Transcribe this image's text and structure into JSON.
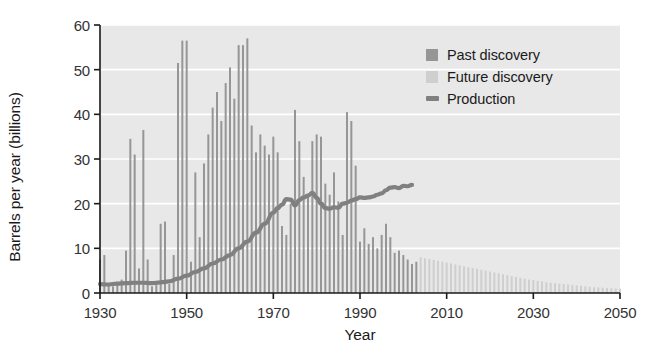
{
  "chart_data": {
    "type": "bar",
    "title": "",
    "xlabel": "Year",
    "ylabel": "Barrels per year (billions)",
    "xlim": [
      1930,
      2050
    ],
    "ylim": [
      0,
      60
    ],
    "xticks": [
      1930,
      1950,
      1970,
      1990,
      2010,
      2030,
      2050
    ],
    "yticks": [
      0,
      10,
      20,
      30,
      40,
      50,
      60
    ],
    "grid": "horizontal-white",
    "legend_position": "top-right-inside",
    "colors": {
      "past_discovery": "#969696",
      "future_discovery": "#cfcfcf",
      "production": "#808080",
      "plot_background": "#e8e8e8",
      "gridline": "#ffffff",
      "axis": "#1a1a1a",
      "text": "#1a1a1a"
    },
    "series": [
      {
        "name": "Past discovery",
        "type": "bar",
        "color": "#969696",
        "x": [
          1930,
          1931,
          1932,
          1933,
          1934,
          1935,
          1936,
          1937,
          1938,
          1939,
          1940,
          1941,
          1942,
          1943,
          1944,
          1945,
          1946,
          1947,
          1948,
          1949,
          1950,
          1951,
          1952,
          1953,
          1954,
          1955,
          1956,
          1957,
          1958,
          1959,
          1960,
          1961,
          1962,
          1963,
          1964,
          1965,
          1966,
          1967,
          1968,
          1969,
          1970,
          1971,
          1972,
          1973,
          1974,
          1975,
          1976,
          1977,
          1978,
          1979,
          1980,
          1981,
          1982,
          1983,
          1984,
          1985,
          1986,
          1987,
          1988,
          1989,
          1990,
          1991,
          1992,
          1993,
          1994,
          1995,
          1996,
          1997,
          1998,
          1999,
          2000,
          2001,
          2002,
          2003
        ],
        "values": [
          7.5,
          8.5,
          2.0,
          1.5,
          2.5,
          3.0,
          9.5,
          34.5,
          31.0,
          5.5,
          36.5,
          7.5,
          1.5,
          2.0,
          15.5,
          16.0,
          2.0,
          8.5,
          51.5,
          56.5,
          56.5,
          7.0,
          27.0,
          12.5,
          29.0,
          35.5,
          41.5,
          45.0,
          38.5,
          47.0,
          50.5,
          43.5,
          55.5,
          55.5,
          57.0,
          37.5,
          31.5,
          35.5,
          33.0,
          31.0,
          35.0,
          31.5,
          15.0,
          13.0,
          20.0,
          41.0,
          34.0,
          26.0,
          22.0,
          34.0,
          35.5,
          35.0,
          24.5,
          22.0,
          27.0,
          20.5,
          13.0,
          40.5,
          38.5,
          28.5,
          11.5,
          14.5,
          11.0,
          12.5,
          10.0,
          13.0,
          15.5,
          12.5,
          9.0,
          9.5,
          8.5,
          7.5,
          6.5,
          7.0
        ]
      },
      {
        "name": "Future discovery",
        "type": "bar",
        "color": "#cfcfcf",
        "x": [
          2004,
          2005,
          2006,
          2007,
          2008,
          2009,
          2010,
          2011,
          2012,
          2013,
          2014,
          2015,
          2016,
          2017,
          2018,
          2019,
          2020,
          2021,
          2022,
          2023,
          2024,
          2025,
          2026,
          2027,
          2028,
          2029,
          2030,
          2031,
          2032,
          2033,
          2034,
          2035,
          2036,
          2037,
          2038,
          2039,
          2040,
          2041,
          2042,
          2043,
          2044,
          2045,
          2046,
          2047,
          2048,
          2049,
          2050
        ],
        "values": [
          8.0,
          7.8,
          7.6,
          7.4,
          7.2,
          7.0,
          6.8,
          6.6,
          6.4,
          6.2,
          6.0,
          5.8,
          5.6,
          5.4,
          5.2,
          5.0,
          4.8,
          4.6,
          4.4,
          4.2,
          4.0,
          3.8,
          3.6,
          3.4,
          3.2,
          3.0,
          2.9,
          2.7,
          2.6,
          2.4,
          2.3,
          2.2,
          2.1,
          2.0,
          1.9,
          1.8,
          1.7,
          1.6,
          1.5,
          1.4,
          1.3,
          1.25,
          1.2,
          1.1,
          1.05,
          1.0,
          0.95
        ]
      },
      {
        "name": "Production",
        "type": "line",
        "color": "#808080",
        "x": [
          1930,
          1932,
          1934,
          1936,
          1938,
          1940,
          1942,
          1944,
          1946,
          1948,
          1950,
          1952,
          1954,
          1956,
          1958,
          1960,
          1962,
          1964,
          1966,
          1968,
          1970,
          1971,
          1972,
          1973,
          1974,
          1975,
          1976,
          1977,
          1978,
          1979,
          1980,
          1981,
          1982,
          1983,
          1984,
          1985,
          1986,
          1987,
          1988,
          1989,
          1990,
          1991,
          1992,
          1993,
          1994,
          1995,
          1996,
          1997,
          1998,
          1999,
          2000,
          2001,
          2002
        ],
        "values": [
          2.0,
          1.9,
          2.1,
          2.2,
          2.3,
          2.3,
          2.2,
          2.4,
          2.6,
          3.2,
          3.9,
          4.7,
          5.5,
          6.6,
          7.5,
          8.5,
          10.0,
          11.5,
          13.5,
          15.5,
          18.0,
          19.0,
          19.8,
          21.0,
          20.9,
          19.6,
          20.8,
          21.4,
          21.8,
          22.4,
          21.3,
          20.0,
          19.0,
          18.9,
          19.2,
          19.1,
          20.0,
          20.2,
          20.7,
          21.0,
          21.4,
          21.3,
          21.4,
          21.6,
          22.0,
          22.3,
          23.0,
          23.6,
          23.7,
          23.5,
          24.0,
          23.9,
          24.2
        ]
      }
    ],
    "annotations": []
  },
  "axis": {
    "ylabel": "Barrels per year (billions)",
    "xlabel": "Year",
    "ytick_labels": [
      "0",
      "10",
      "20",
      "30",
      "40",
      "50",
      "60"
    ],
    "xtick_labels": [
      "1930",
      "1950",
      "1970",
      "1990",
      "2010",
      "2030",
      "2050"
    ]
  },
  "legend": {
    "items": [
      {
        "label": "Past discovery",
        "marker": "square",
        "color": "#969696"
      },
      {
        "label": "Future discovery",
        "marker": "square",
        "color": "#cfcfcf"
      },
      {
        "label": "Production",
        "marker": "line",
        "color": "#808080"
      }
    ]
  }
}
